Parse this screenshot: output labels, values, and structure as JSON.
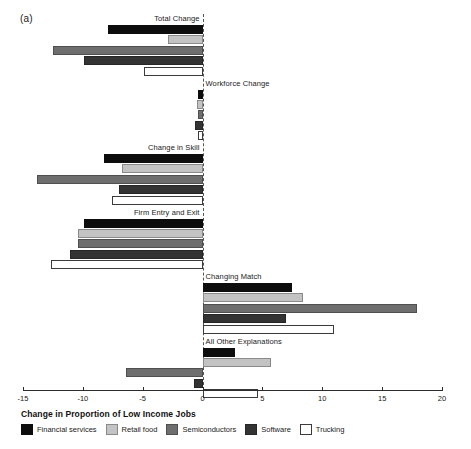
{
  "panel": {
    "label": "(a)"
  },
  "legend": {
    "title": "Change in Proportion of Low Income Jobs",
    "items": [
      {
        "label": "Financial services",
        "color": "#0d0d0d",
        "swatch": "swatch-financial-services"
      },
      {
        "label": "Retail food",
        "color": "#c3c3c3",
        "swatch": "swatch-retail-food"
      },
      {
        "label": "Semiconductors",
        "color": "#6e6e6e",
        "swatch": "swatch-semiconductors"
      },
      {
        "label": "Software",
        "color": "#333333",
        "swatch": "swatch-software"
      },
      {
        "label": "Trucking",
        "color": "#ffffff",
        "swatch": "swatch-trucking"
      }
    ]
  },
  "chart_data": {
    "type": "bar",
    "orientation": "horizontal",
    "title": "",
    "xlabel": "Change in Proportion of Low Income Jobs",
    "ylabel": "",
    "xlim": [
      -15,
      20
    ],
    "xticks": [
      -15,
      -10,
      -5,
      0,
      5,
      10,
      15,
      20
    ],
    "xtick_labels": [
      "-15",
      "-10",
      "-5",
      "0",
      "5",
      "10",
      "15",
      "20"
    ],
    "grid": false,
    "zero_reference_line": true,
    "legend_position": "bottom",
    "categories": [
      "Total Change",
      "Workforce Change",
      "Change in Skill",
      "Firm Entry and Exit",
      "Changing Match",
      "All Other Explanations"
    ],
    "label_side": [
      "neg",
      "pos",
      "neg",
      "neg",
      "pos",
      "pos"
    ],
    "series": [
      {
        "name": "Financial services",
        "color": "#0d0d0d",
        "values": [
          -7.9,
          -0.4,
          -8.2,
          -9.9,
          7.5,
          2.7
        ]
      },
      {
        "name": "Retail food",
        "color": "#c3c3c3",
        "values": [
          -2.9,
          -0.5,
          -6.7,
          -10.4,
          8.4,
          5.7
        ]
      },
      {
        "name": "Semiconductors",
        "color": "#6e6e6e",
        "values": [
          -12.5,
          -0.4,
          -13.8,
          -10.4,
          17.9,
          -6.4
        ]
      },
      {
        "name": "Software",
        "color": "#333333",
        "values": [
          -9.9,
          -0.6,
          -7.0,
          -11.1,
          7.0,
          -0.7
        ]
      },
      {
        "name": "Trucking",
        "color": "#ffffff",
        "values": [
          -4.9,
          -0.4,
          -7.6,
          -12.7,
          11.0,
          4.6
        ]
      }
    ]
  }
}
